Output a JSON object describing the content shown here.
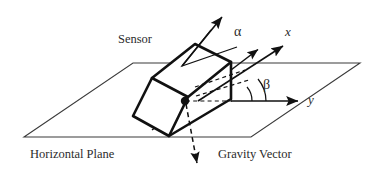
{
  "figure": {
    "type": "technical-diagram",
    "background_color": "#ffffff",
    "line_color": "#1a1a1a",
    "text_color": "#2b2b2b"
  },
  "labels": {
    "sensor": "Sensor",
    "horizontal_plane": "Horizontal Plane",
    "gravity_vector": "Gravity Vector",
    "x_axis": "x",
    "y_axis": "y",
    "alpha": "α",
    "beta": "β"
  },
  "geometry": {
    "plane": {
      "name": "horizontal-plane-parallelogram",
      "points": "24,137 133,63 360,63 251,137"
    },
    "sensor_box": {
      "name": "sensor-3d-box",
      "top_face": "152,78 195,44 231,62 188,97",
      "front_face": "152,78 188,97 169,136 133,116",
      "right_face": "188,97 231,62 231,99 169,136",
      "edges": [
        "152,78 195,44",
        "195,44 231,62",
        "231,62 188,97",
        "188,97 152,78",
        "152,78 133,116",
        "133,116 169,136",
        "169,136 188,97",
        "231,62 231,99",
        "231,99 169,136"
      ]
    },
    "center_dot": {
      "cx": 185,
      "cy": 101,
      "r": 4.2
    },
    "normal_arrow": {
      "from": "182,66",
      "to": "224,14"
    },
    "x_axis_arrow": {
      "from": "196,101",
      "to": "286,44"
    },
    "x_axis_arrow_secondary": {
      "from": "152,130",
      "to": "260,48"
    },
    "y_axis_arrow": {
      "from": "231,101",
      "to": "302,101"
    },
    "gravity_arrow": {
      "from": "185,105",
      "to": "198,170"
    },
    "alpha_arc": {
      "center": "182,66",
      "radius": 46,
      "from_deg": -51,
      "to_deg": -19
    },
    "beta_arc": {
      "center": "231,101",
      "radius": 40,
      "from_deg": 0,
      "to_deg": -37
    }
  }
}
